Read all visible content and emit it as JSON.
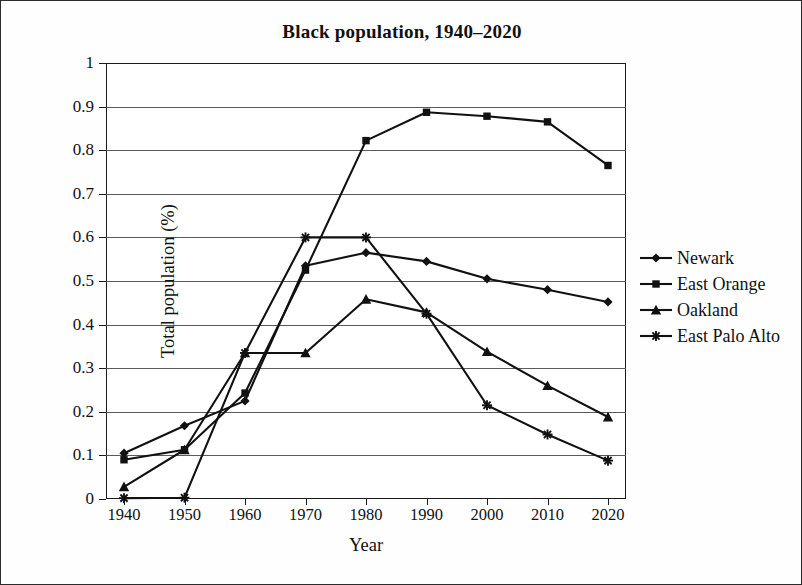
{
  "figure": {
    "title": "Black population, 1940–2020",
    "xlabel": "Year",
    "ylabel": "Total population (%)"
  },
  "axes": {
    "y_ticks": [
      "1",
      "0.9",
      "0.8",
      "0.7",
      "0.6",
      "0.5",
      "0.4",
      "0.3",
      "0.2",
      "0.1",
      "0"
    ],
    "x_ticks": [
      "1940",
      "1950",
      "1960",
      "1970",
      "1980",
      "1990",
      "2000",
      "2010",
      "2020"
    ]
  },
  "legend": {
    "items": [
      {
        "label": "Newark",
        "marker": "diamond"
      },
      {
        "label": "East Orange",
        "marker": "square"
      },
      {
        "label": "Oakland",
        "marker": "triangle"
      },
      {
        "label": "East Palo Alto",
        "marker": "cross"
      }
    ]
  },
  "chart_data": {
    "type": "line",
    "title": "Black population, 1940–2020",
    "xlabel": "Year",
    "ylabel": "Total population (%)",
    "x": [
      1940,
      1950,
      1960,
      1970,
      1980,
      1990,
      2000,
      2010,
      2020
    ],
    "ylim": [
      0,
      1
    ],
    "ytick_step": 0.1,
    "grid": "horizontal",
    "legend_position": "right",
    "line_color": "#111111",
    "series": [
      {
        "name": "Newark",
        "marker": "diamond",
        "values": [
          0.105,
          0.168,
          0.225,
          0.535,
          0.565,
          0.545,
          0.505,
          0.48,
          0.452
        ]
      },
      {
        "name": "East Orange",
        "marker": "square",
        "values": [
          0.09,
          0.113,
          0.243,
          0.525,
          0.822,
          0.887,
          0.878,
          0.865,
          0.765
        ]
      },
      {
        "name": "Oakland",
        "marker": "triangle",
        "values": [
          0.028,
          0.113,
          0.335,
          0.335,
          0.458,
          0.428,
          0.338,
          0.26,
          0.188
        ]
      },
      {
        "name": "East Palo Alto",
        "marker": "cross",
        "values": [
          0.002,
          0.003,
          0.335,
          0.6,
          0.6,
          0.425,
          0.215,
          0.148,
          0.088
        ]
      }
    ]
  }
}
